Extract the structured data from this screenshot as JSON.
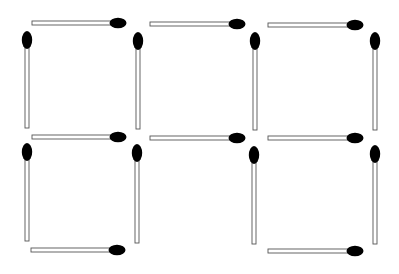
{
  "puzzle": {
    "description": "Matchstick puzzle: grid of 2 rows x 3 columns of squares with middle-bottom square open",
    "stick_color": "#ffffff",
    "stick_outline": "#555555",
    "head_color": "#000000",
    "background": "#ffffff",
    "matches": [
      {
        "id": "h-top-1",
        "orient": "h",
        "x1": 32,
        "x2": 112,
        "y": 23,
        "hx": 118,
        "hy": 23
      },
      {
        "id": "h-top-2",
        "orient": "h",
        "x1": 150,
        "x2": 231,
        "y": 24,
        "hx": 237,
        "hy": 24
      },
      {
        "id": "h-top-3",
        "orient": "h",
        "x1": 268,
        "x2": 348,
        "y": 25,
        "hx": 355,
        "hy": 25
      },
      {
        "id": "h-mid-1",
        "orient": "h",
        "x1": 32,
        "x2": 112,
        "y": 137,
        "hx": 118,
        "hy": 137
      },
      {
        "id": "h-mid-2",
        "orient": "h",
        "x1": 150,
        "x2": 231,
        "y": 138,
        "hx": 237,
        "hy": 138
      },
      {
        "id": "h-mid-3",
        "orient": "h",
        "x1": 268,
        "x2": 348,
        "y": 138,
        "hx": 355,
        "hy": 138
      },
      {
        "id": "h-bot-1",
        "orient": "h",
        "x1": 31,
        "x2": 111,
        "y": 250,
        "hx": 117,
        "hy": 250
      },
      {
        "id": "h-bot-3",
        "orient": "h",
        "x1": 268,
        "x2": 348,
        "y": 251,
        "hx": 355,
        "hy": 251
      },
      {
        "id": "v-top-1",
        "orient": "v",
        "x": 27,
        "y1": 47,
        "y2": 128,
        "hx": 27,
        "hy": 40
      },
      {
        "id": "v-top-2",
        "orient": "v",
        "x": 138,
        "y1": 48,
        "y2": 129,
        "hx": 138,
        "hy": 41
      },
      {
        "id": "v-top-3",
        "orient": "v",
        "x": 255,
        "y1": 48,
        "y2": 130,
        "hx": 255,
        "hy": 41
      },
      {
        "id": "v-top-4",
        "orient": "v",
        "x": 375,
        "y1": 48,
        "y2": 130,
        "hx": 375,
        "hy": 41
      },
      {
        "id": "v-bot-1",
        "orient": "v",
        "x": 27,
        "y1": 159,
        "y2": 241,
        "hx": 27,
        "hy": 152
      },
      {
        "id": "v-bot-2",
        "orient": "v",
        "x": 137,
        "y1": 160,
        "y2": 243,
        "hx": 137,
        "hy": 153
      },
      {
        "id": "v-bot-3",
        "orient": "v",
        "x": 254,
        "y1": 162,
        "y2": 244,
        "hx": 254,
        "hy": 155
      },
      {
        "id": "v-bot-4",
        "orient": "v",
        "x": 375,
        "y1": 161,
        "y2": 244,
        "hx": 375,
        "hy": 154
      }
    ]
  }
}
